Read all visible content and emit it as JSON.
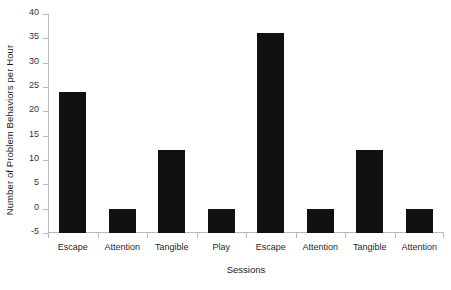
{
  "chart_data": {
    "type": "bar",
    "title": "",
    "xlabel": "Sessions",
    "ylabel": "Number of Problem Behaviors per Hour",
    "categories": [
      "Escape",
      "Attention",
      "Tangible",
      "Play",
      "Escape",
      "Attention",
      "Tangible",
      "Attention"
    ],
    "values": [
      24,
      0,
      12,
      0,
      36,
      0,
      12,
      0
    ],
    "ylim": [
      -5,
      40
    ],
    "ytick_labels": [
      "-5",
      "0",
      "5",
      "10",
      "15",
      "20",
      "25",
      "30",
      "35",
      "40"
    ],
    "ytick_values": [
      -5,
      0,
      5,
      10,
      15,
      20,
      25,
      30,
      35,
      40
    ],
    "grid": false,
    "legend": false,
    "bar_color": "#111111",
    "axis_color": "#b9b9b9",
    "background_color": "#ffffff"
  }
}
